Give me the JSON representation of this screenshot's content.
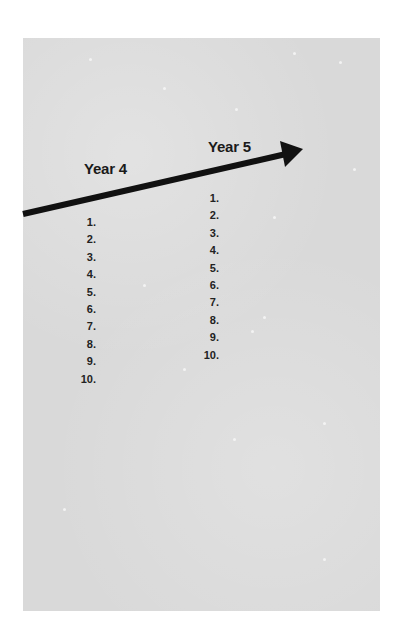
{
  "timeline": {
    "colors": {
      "panel": "#d9d9d9",
      "arrow": "#111111",
      "text": "#1a1a1a"
    },
    "columns": [
      {
        "heading": "Year 4",
        "items": [
          "1.",
          "2.",
          "3.",
          "4.",
          "5.",
          "6.",
          "7.",
          "8.",
          "9.",
          "10."
        ]
      },
      {
        "heading": "Year 5",
        "items": [
          "1.",
          "2.",
          "3.",
          "4.",
          "5.",
          "6.",
          "7.",
          "8.",
          "9.",
          "10."
        ]
      }
    ]
  }
}
